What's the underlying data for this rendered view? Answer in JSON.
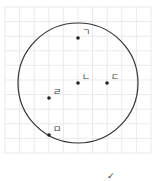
{
  "diagram": {
    "type": "circle-on-grid",
    "grid": {
      "x0": 5,
      "y0": 7,
      "step": 14.6,
      "cols": 10,
      "rows": 10,
      "color": "#dcdcdc"
    },
    "circle": {
      "cx": 78,
      "cy": 83,
      "r": 60,
      "stroke": "#333333"
    },
    "points": [
      {
        "label": "ㄱ",
        "x": 78,
        "y": 38,
        "lx": 82,
        "ly": 35
      },
      {
        "label": "ㄴ",
        "x": 78,
        "y": 83,
        "lx": 82,
        "ly": 80
      },
      {
        "label": "ㄷ",
        "x": 107,
        "y": 83,
        "lx": 111,
        "ly": 80
      },
      {
        "label": "ㄹ",
        "x": 49,
        "y": 98,
        "lx": 53,
        "ly": 95
      },
      {
        "label": "ㅁ",
        "x": 49,
        "y": 135,
        "lx": 53,
        "ly": 132
      }
    ],
    "mark": {
      "symbol": "✓",
      "x": 107,
      "y": 179
    }
  }
}
